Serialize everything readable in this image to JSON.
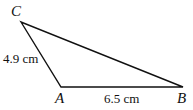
{
  "diagram": {
    "type": "triangle",
    "stroke_color": "#111111",
    "vertices": [
      {
        "id": "C",
        "label": "C",
        "x": 21,
        "y": 22
      },
      {
        "id": "A",
        "label": "A",
        "x": 61,
        "y": 87
      },
      {
        "id": "B",
        "label": "B",
        "x": 183,
        "y": 87
      }
    ],
    "sides": [
      {
        "from": "C",
        "to": "A",
        "label": "4.9 cm"
      },
      {
        "from": "A",
        "to": "B",
        "label": "6.5 cm"
      },
      {
        "from": "B",
        "to": "C",
        "label": ""
      }
    ]
  }
}
